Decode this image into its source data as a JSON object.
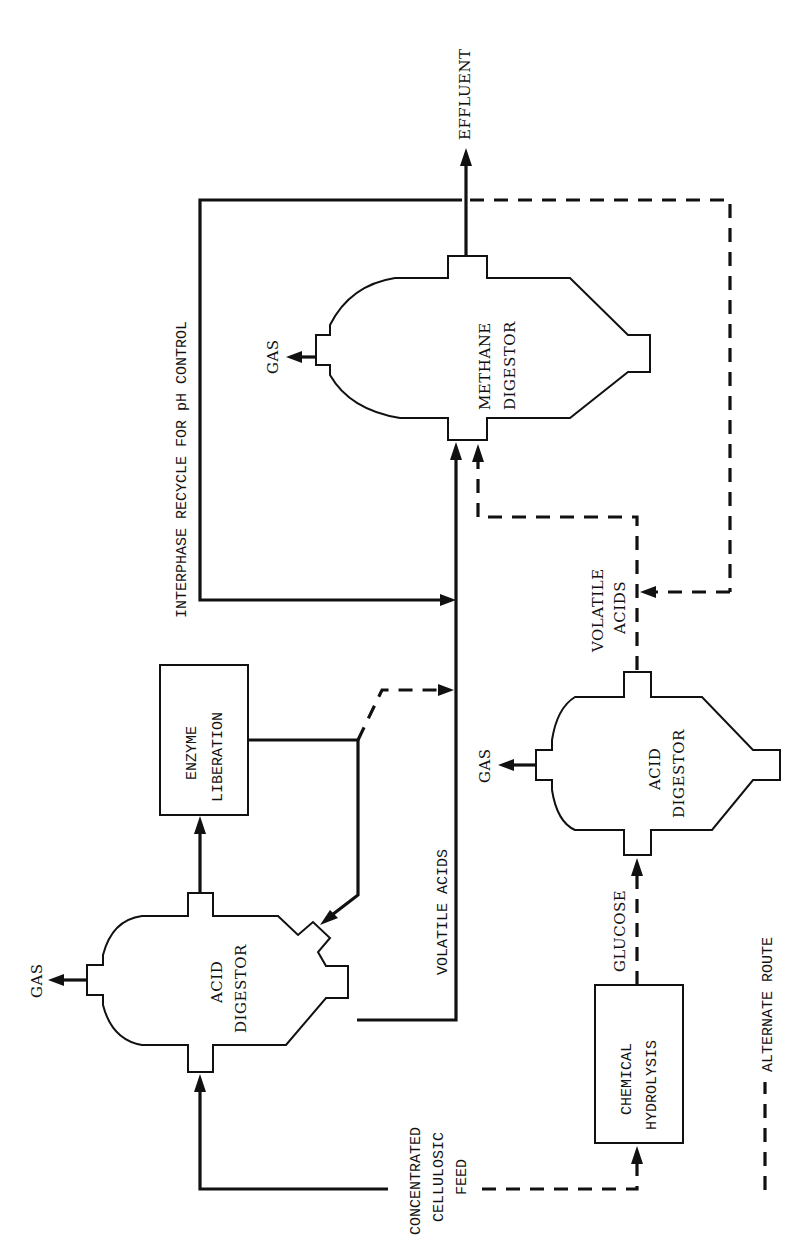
{
  "diagram": {
    "orientation": "rotated-90-ccw",
    "units": {
      "acid_digestor_primary": {
        "label_line1": "ACID",
        "label_line2": "DIGESTOR"
      },
      "acid_digestor_alternate": {
        "label_line1": "ACID",
        "label_line2": "DIGESTOR"
      },
      "methane_digestor": {
        "label_line1": "METHANE",
        "label_line2": "DIGESTOR"
      },
      "enzyme_liberation": {
        "label_line1": "ENZYME",
        "label_line2": "LIBERATION"
      },
      "chemical_hydrolysis": {
        "label_line1": "CHEMICAL",
        "label_line2": "HYDROLYSIS"
      }
    },
    "streams": {
      "feed": {
        "line1": "CONCENTRATED",
        "line2": "CELLULOSIC",
        "line3": "FEED"
      },
      "gas_primary": "GAS",
      "gas_methane": "GAS",
      "gas_alternate": "GAS",
      "effluent": "EFFLUENT",
      "volatile_acids_main": "VOLATILE ACIDS",
      "volatile_acids_alt": {
        "line1": "VOLATILE",
        "line2": "ACIDS"
      },
      "glucose": "GLUCOSE",
      "recycle": "INTERPHASE RECYCLE FOR pH CONTROL"
    },
    "legend": {
      "dashed_label": "ALTERNATE ROUTE"
    }
  }
}
